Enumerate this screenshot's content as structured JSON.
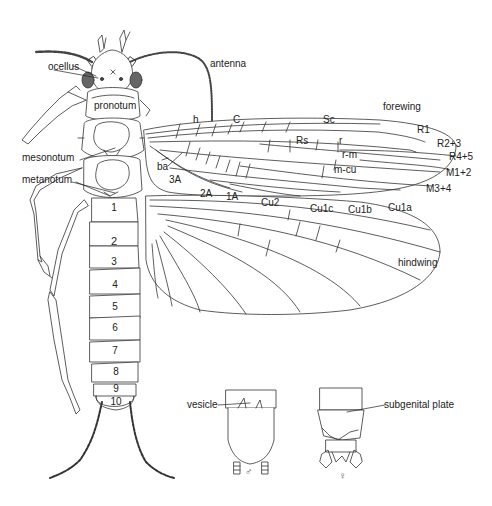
{
  "figure": {
    "line_color": "#333333",
    "background": "#ffffff"
  },
  "head_labels": {
    "ocellus": "ocellus",
    "antenna": "antenna"
  },
  "thorax_labels": {
    "pronotum": "pronotum",
    "mesonotum": "mesonotum",
    "metanotum": "metanotum"
  },
  "forewing": {
    "title": "forewing",
    "veins": {
      "h": "h",
      "C": "C",
      "Sc": "Sc",
      "Rs": "Rs",
      "r": "r",
      "r_m": "r-m",
      "m_cu": "m-cu",
      "R1": "R1",
      "R2_3": "R2+3",
      "R4_5": "R4+5",
      "M1_2": "M1+2",
      "M3_4": "M3+4",
      "Cu1a": "Cu1a",
      "Cu1b": "Cu1b",
      "Cu1c": "Cu1c",
      "Cu2": "Cu2",
      "ba": "ba",
      "A1": "1A",
      "A2": "2A",
      "A3": "3A"
    }
  },
  "hindwing": {
    "title": "hindwing"
  },
  "abdomen": {
    "segments": [
      "1",
      "2",
      "3",
      "4",
      "5",
      "6",
      "7",
      "8",
      "9",
      "10"
    ]
  },
  "terminalia": {
    "male": {
      "symbol": "♂",
      "label": "vesicle"
    },
    "female": {
      "symbol": "♀",
      "label": "subgenital plate"
    }
  }
}
